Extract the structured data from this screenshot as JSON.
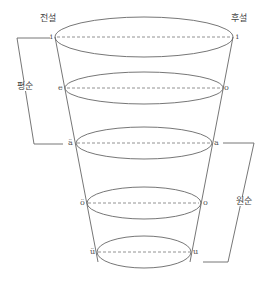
{
  "diagram": {
    "type": "vowel-funnel",
    "headers": {
      "front": "전설",
      "back": "후설"
    },
    "groups": {
      "unrounded": "평순",
      "rounded": "원순"
    },
    "levels": [
      {
        "front": "i",
        "back": "i"
      },
      {
        "front": "e",
        "back": "o"
      },
      {
        "front": "ä",
        "back": "a"
      },
      {
        "front": "ö",
        "back": "o"
      },
      {
        "front": "ü",
        "back": "u"
      }
    ],
    "colors": {
      "line": "#666666",
      "text": "#555555"
    }
  }
}
